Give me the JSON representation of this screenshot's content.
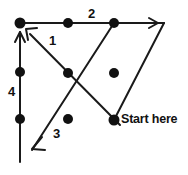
{
  "figure": {
    "background_color": "#ffffff",
    "stroke_color": "#1a1a1a",
    "dot_color": "#111111",
    "width": 188,
    "height": 175,
    "vertices": {
      "top_left": [
        20,
        23
      ],
      "top_right_apex": [
        164,
        23
      ],
      "bottom_left": [
        20,
        162
      ],
      "start_point": [
        114,
        120
      ],
      "crossing_point": [
        92,
        96
      ]
    },
    "dots": [
      {
        "name": "dot-top-left-corner",
        "x": 20,
        "y": 23
      },
      {
        "name": "dot-top-mid-left",
        "x": 68,
        "y": 23
      },
      {
        "name": "dot-top-mid-right",
        "x": 114,
        "y": 23
      },
      {
        "name": "dot-left-upper",
        "x": 20,
        "y": 72
      },
      {
        "name": "dot-left-lower",
        "x": 20,
        "y": 119
      },
      {
        "name": "dot-diag1-mid",
        "x": 68,
        "y": 73
      },
      {
        "name": "dot-diag-start-mid",
        "x": 114,
        "y": 73
      },
      {
        "name": "dot-diag3-mid",
        "x": 68,
        "y": 119
      },
      {
        "name": "dot-start-here",
        "x": 114,
        "y": 120
      }
    ],
    "segments": [
      {
        "name": "segment-start-to-apex",
        "label": "",
        "from": [
          114,
          120
        ],
        "to": [
          164,
          23
        ],
        "arrow": "none"
      },
      {
        "name": "segment-2-top-horizontal",
        "label": "2",
        "from": [
          20,
          23
        ],
        "to": [
          164,
          23
        ],
        "arrow": "end"
      },
      {
        "name": "segment-1-diagonal-up-left",
        "label": "1",
        "from": [
          92,
          96
        ],
        "to": [
          20,
          23
        ],
        "arrow": "end"
      },
      {
        "name": "segment-3-diagonal-down-left",
        "label": "3",
        "from": [
          92,
          96
        ],
        "to": [
          20,
          162
        ],
        "arrow": "end"
      },
      {
        "name": "segment-4-left-vertical",
        "label": "4",
        "from": [
          20,
          162
        ],
        "to": [
          20,
          23
        ],
        "arrow": "end"
      }
    ],
    "labels": {
      "one": "1",
      "two": "2",
      "three": "3",
      "four": "4",
      "start_here": "Start here"
    }
  }
}
